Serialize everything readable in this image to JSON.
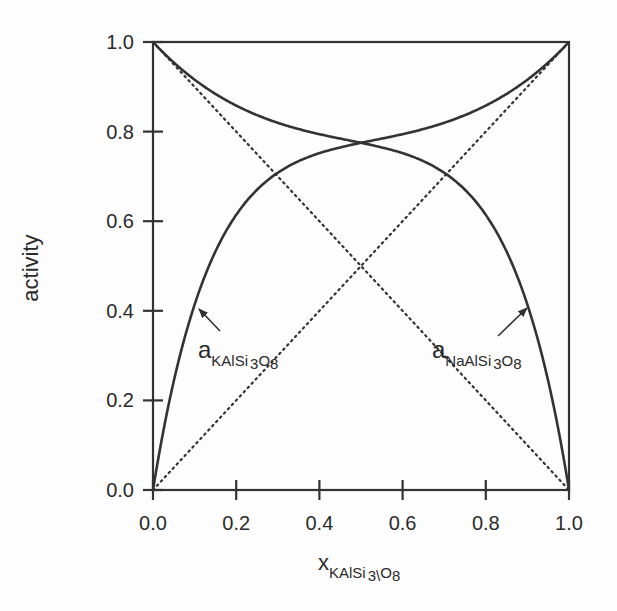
{
  "chart_data": {
    "type": "line",
    "title": "",
    "xlabel": "x_KAlSi3\\O8",
    "xlabel_main": "x",
    "xlabel_sub": "KAlSi",
    "xlabel_sub2": "3\\",
    "xlabel_sub3": "O",
    "xlabel_sub4": "8",
    "ylabel": "activity",
    "xlim": [
      0.0,
      1.0
    ],
    "ylim": [
      0.0,
      1.0
    ],
    "grid": false,
    "legend": "none (inline annotations with arrows)",
    "xticks": [
      "0.0",
      "0.2",
      "0.4",
      "0.6",
      "0.8",
      "1.0"
    ],
    "yticks": [
      "0.0",
      "0.2",
      "0.4",
      "0.6",
      "0.8",
      "1.0"
    ],
    "x": [
      0.0,
      0.025,
      0.05,
      0.075,
      0.1,
      0.15,
      0.2,
      0.25,
      0.3,
      0.35,
      0.4,
      0.45,
      0.5,
      0.55,
      0.6,
      0.65,
      0.7,
      0.75,
      0.8,
      0.85,
      0.9,
      0.95,
      1.0
    ],
    "series": [
      {
        "name": "a_KAlSi3O8",
        "style": "solid",
        "values": [
          0.0,
          0.1387,
          0.2425,
          0.3255,
          0.4128,
          0.5309,
          0.6131,
          0.67,
          0.7079,
          0.7346,
          0.7514,
          0.7636,
          0.7751,
          0.782,
          0.794,
          0.8061,
          0.8196,
          0.8384,
          0.8569,
          0.885,
          0.9159,
          0.9544,
          1.0
        ]
      },
      {
        "name": "a_NaAlSi3O8",
        "style": "solid",
        "values": [
          1.0,
          0.9544,
          0.9159,
          0.885,
          0.8569,
          0.8384,
          0.8196,
          0.8061,
          0.794,
          0.782,
          0.7751,
          0.7636,
          0.7751,
          0.7636,
          0.7514,
          0.7346,
          0.7079,
          0.67,
          0.6131,
          0.5309,
          0.4128,
          0.2425,
          0.0
        ]
      },
      {
        "name": "ideal KAlSi3O8 (Raoult)",
        "style": "dotted",
        "values": [
          0.0,
          1.0
        ],
        "x": [
          0.0,
          1.0
        ]
      },
      {
        "name": "ideal NaAlSi3O8 (Raoult)",
        "style": "dotted",
        "values": [
          1.0,
          0.0
        ],
        "x": [
          0.0,
          1.0
        ]
      }
    ],
    "annotations": [
      {
        "text_main": "a",
        "text_sub": "KAlSi",
        "text_sub2": "3",
        "text_sub3": "O",
        "text_sub4": "8",
        "arrow_to": [
          0.11,
          0.41
        ]
      },
      {
        "text_main": "a",
        "text_sub": "NaAlSi",
        "text_sub2": "3",
        "text_sub3": "O",
        "text_sub4": "8",
        "arrow_to": [
          0.9,
          0.41
        ]
      }
    ],
    "intersection": {
      "x": 0.5,
      "y": 0.775
    }
  },
  "colors": {
    "line": "#333333",
    "background": "#fdfdfd",
    "text": "#2a2a2a"
  }
}
